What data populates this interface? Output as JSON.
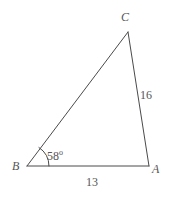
{
  "figure": {
    "kind": "triangle-diagram",
    "background_color": "#ffffff",
    "stroke_color": "#4a4a4a",
    "text_color": "#555555",
    "stroke_width": 1
  },
  "vertices": [
    {
      "name": "C",
      "label": "C",
      "x": 128,
      "y": 32
    },
    {
      "name": "A",
      "label": "A",
      "x": 149,
      "y": 166
    },
    {
      "name": "B",
      "label": "B",
      "x": 27,
      "y": 166
    }
  ],
  "sides": [
    {
      "name": "BC",
      "from": "B",
      "to": "C",
      "label": ""
    },
    {
      "name": "CA",
      "from": "C",
      "to": "A",
      "label": "16"
    },
    {
      "name": "BA",
      "from": "B",
      "to": "A",
      "label": "13"
    }
  ],
  "angles": [
    {
      "at": "B",
      "value": "58",
      "degree_symbol": "o",
      "arc_radius": 22
    }
  ],
  "labels": {
    "vertex_C": "C",
    "vertex_A": "A",
    "vertex_B": "B",
    "side_CA": "16",
    "side_BA": "13",
    "angle_B_value": "58",
    "angle_B_degree": "o"
  }
}
